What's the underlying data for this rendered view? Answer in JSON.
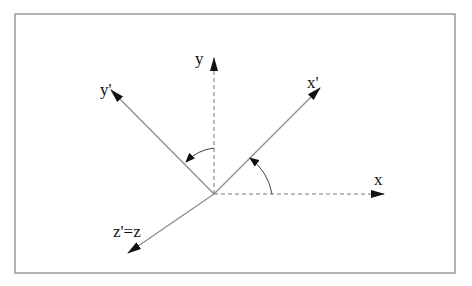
{
  "diagram": {
    "labels": {
      "y": "y",
      "y_prime": "y'",
      "x": "x",
      "x_prime": "x'",
      "z": "z'=z"
    },
    "colors": {
      "line": "#8a8a8a",
      "arrow": "#111111",
      "frame": "#9a9a9a"
    }
  }
}
